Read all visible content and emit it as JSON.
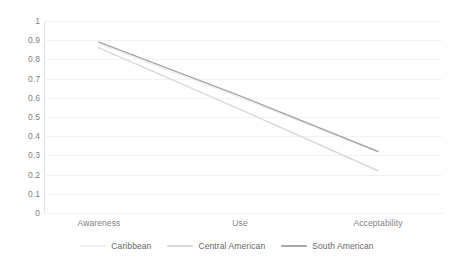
{
  "chart_data": {
    "type": "line",
    "title": "",
    "subtitle": "",
    "xlabel": "",
    "ylabel": "",
    "categories": [
      "Awareness",
      "Use",
      "Acceptability"
    ],
    "ylim": [
      0,
      1
    ],
    "yticks": [
      "0",
      "0.1",
      "0.2",
      "0.3",
      "0.4",
      "0.5",
      "0.6",
      "0.7",
      "0.8",
      "0.9",
      "1"
    ],
    "ytick_values": [
      0,
      0.1,
      0.2,
      0.3,
      0.4,
      0.5,
      0.6,
      0.7,
      0.8,
      0.9,
      1
    ],
    "grid": true,
    "grid_axis": "y",
    "legend_position": "bottom",
    "series": [
      {
        "name": "Caribbean",
        "values": [
          0.88,
          0.6,
          0.32
        ],
        "color": "#f2f2f2"
      },
      {
        "name": "Central American",
        "values": [
          0.86,
          0.54,
          0.22
        ],
        "color": "#d9d9d9"
      },
      {
        "name": "South American",
        "values": [
          0.89,
          0.61,
          0.32
        ],
        "color": "#a6a6a6"
      }
    ]
  },
  "axes": {
    "y_tick_labels": [
      "1",
      "0.9",
      "0.8",
      "0.7",
      "0.6",
      "0.5",
      "0.4",
      "0.3",
      "0.2",
      "0.1",
      "0"
    ],
    "x_tick_labels": [
      "Awareness",
      "Use",
      "Acceptability"
    ]
  },
  "legend": {
    "items": [
      {
        "label": "Caribbean",
        "color": "#f2f2f2"
      },
      {
        "label": "Central American",
        "color": "#d9d9d9"
      },
      {
        "label": "South American",
        "color": "#a6a6a6"
      }
    ]
  },
  "colors": {
    "background": "#ffffff",
    "gridline": "#f2f2f2",
    "axis": "#e2e2e2",
    "tick_text": "#7f7f7f",
    "legend_text": "#666666"
  }
}
